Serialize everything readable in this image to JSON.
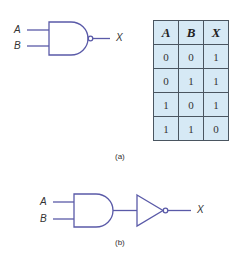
{
  "diagram_a": {
    "gate_type": "NAND",
    "inputs": [
      "A",
      "B"
    ],
    "output": "X",
    "caption": "(a)"
  },
  "truth_table": {
    "headers": [
      "A",
      "B",
      "X"
    ],
    "rows": [
      [
        "0",
        "0",
        "1"
      ],
      [
        "0",
        "1",
        "1"
      ],
      [
        "1",
        "0",
        "1"
      ],
      [
        "1",
        "1",
        "0"
      ]
    ],
    "fill_color": "#d6e9f5"
  },
  "diagram_b": {
    "gates": [
      "AND",
      "NOT"
    ],
    "inputs": [
      "A",
      "B"
    ],
    "output": "X",
    "caption": "(b)"
  },
  "colors": {
    "wire": "#5a5aa8",
    "text": "#333333"
  }
}
